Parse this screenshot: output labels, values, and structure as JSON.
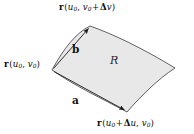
{
  "figure": {
    "name": "parametric-surface-patch",
    "background_color": "#ffffff",
    "patch": {
      "fill_color": "#e8e8e8",
      "stroke_color": "#3a3a3a",
      "region_label": "R"
    },
    "labels": {
      "corner_top": {
        "vector_symbol": "r",
        "open_paren": "(",
        "u": "u",
        "u_sub": "0",
        "comma": ", ",
        "v": "v",
        "v_sub": "0",
        "plus": "+",
        "delta": "Δ",
        "delta_var": "v",
        "close_paren": ")"
      },
      "corner_left": {
        "vector_symbol": "r",
        "open_paren": "(",
        "u": "u",
        "u_sub": "0",
        "comma": ", ",
        "v": "v",
        "v_sub": "0",
        "close_paren": ")"
      },
      "corner_bottom": {
        "vector_symbol": "r",
        "open_paren": "(",
        "u": "u",
        "u_sub": "0",
        "plus": "+",
        "delta": "Δ",
        "delta_var": "u",
        "comma": ", ",
        "v": "v",
        "v_sub": "0",
        "close_paren": ")"
      },
      "vector_a": "a",
      "vector_b": "b"
    }
  }
}
